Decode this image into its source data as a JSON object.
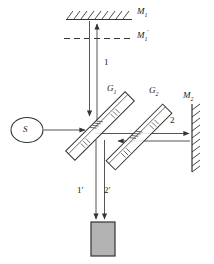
{
  "figure": {
    "type": "optical-ray-diagram",
    "name": "Michelson interferometer schematic",
    "background_color": "#ffffff",
    "line_color": "#333333",
    "detector_fill": "#b3b3b3",
    "width": 214,
    "height": 264
  },
  "labels": {
    "mirror1": {
      "text": "M",
      "sub": "1",
      "prime": "",
      "x": 137,
      "y": 12
    },
    "mirror1_virtual": {
      "text": "M",
      "sub": "1",
      "prime": "′",
      "x": 137,
      "y": 33
    },
    "mirror2": {
      "text": "M",
      "sub": "2",
      "prime": "",
      "x": 186,
      "y": 96
    },
    "plate1": {
      "text": "G",
      "sub": "1",
      "prime": "",
      "x": 108,
      "y": 88
    },
    "plate2": {
      "text": "G",
      "sub": "2",
      "prime": "",
      "x": 150,
      "y": 90
    },
    "source": {
      "text": "S",
      "x": 26,
      "y": 129
    }
  },
  "rays": {
    "beam1": {
      "label": "1",
      "x": 106,
      "y": 62
    },
    "beam2": {
      "label": "2",
      "x": 172,
      "y": 120
    },
    "beam1_out": {
      "label": "1′",
      "x": 79,
      "y": 190
    },
    "beam2_out": {
      "label": "2′",
      "x": 106,
      "y": 190
    }
  },
  "components": {
    "source_ellipse": {
      "name": "light-source",
      "cx": 27,
      "cy": 130,
      "rx": 16,
      "ry": 12
    },
    "beam_splitter_g1": {
      "name": "beam-splitter-plate",
      "angle_deg": -45
    },
    "compensator_g2": {
      "name": "compensator-plate",
      "angle_deg": -45
    },
    "mirror_m1": {
      "name": "mirror-m1",
      "orientation": "horizontal",
      "hatching": "above"
    },
    "mirror_m2": {
      "name": "mirror-m2",
      "orientation": "vertical",
      "hatching": "right"
    },
    "virtual_mirror": {
      "name": "virtual-mirror-m1-prime",
      "style": "dashed"
    },
    "detector": {
      "name": "detector-screen",
      "x": 91,
      "y": 222,
      "w": 24,
      "h": 34
    }
  }
}
